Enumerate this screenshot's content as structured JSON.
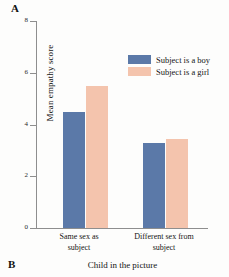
{
  "panels": {
    "top_letter": "A",
    "bottom_letter": "B"
  },
  "legend": {
    "position": "top-right",
    "items": [
      {
        "label": "Subject is a boy",
        "color": "#5b79a8",
        "swatch_icon": "legend-swatch-icon"
      },
      {
        "label": "Subject is a girl",
        "color": "#f4c4ad",
        "swatch_icon": "legend-swatch-icon"
      }
    ]
  },
  "chart_data": {
    "type": "bar",
    "title": "",
    "subtitle": "",
    "xlabel": "Child in the picture",
    "ylabel": "Mean empathy score",
    "categories": [
      "Same sex as subject",
      "Different sex from subject"
    ],
    "category_lines": [
      [
        "Same sex as",
        "subject"
      ],
      [
        "Different sex from",
        "subject"
      ]
    ],
    "series": [
      {
        "name": "Subject is a boy",
        "color": "#5b79a8",
        "values": [
          4.5,
          3.3
        ]
      },
      {
        "name": "Subject is a girl",
        "color": "#f4c4ad",
        "values": [
          5.5,
          3.45
        ]
      }
    ],
    "ylim": [
      0,
      8
    ],
    "yticks": [
      0,
      2,
      4,
      6,
      8
    ],
    "ytick_labels": [
      "0",
      "2",
      "4",
      "6",
      "8"
    ],
    "grid": false,
    "legend_position": "top-right"
  }
}
